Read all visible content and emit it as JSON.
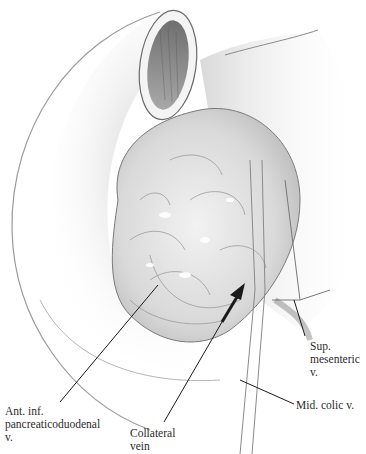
{
  "figure": {
    "type": "surgical anatomical illustration",
    "structures_drawn": [
      "duodenum (cut lumen)",
      "pancreatic head",
      "stomach/colon outline",
      "arrow pointing to collateral vein"
    ],
    "colors": {
      "ink": "#2b2b2b",
      "shading": "#8a8a8a",
      "background": "#ffffff"
    }
  },
  "labels": {
    "aipd": {
      "line1": "Ant. inf.",
      "line2": "pancreaticoduodenal",
      "line3": "v."
    },
    "collateral": {
      "line1": "Collateral",
      "line2": "vein"
    },
    "smv": {
      "line1": "Sup.",
      "line2": "mesenteric",
      "line3": "v."
    },
    "mcv": {
      "line1": "Mid. colic v."
    }
  }
}
